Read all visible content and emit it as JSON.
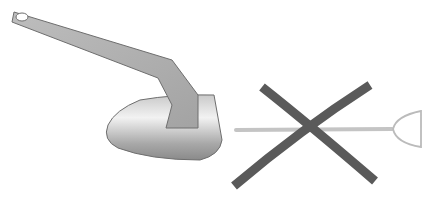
{
  "illustration": {
    "subject": "anchor-vs-crossed-out-shovel-style-anchor",
    "colors": {
      "background": "#ffffff",
      "anchor_fill_light": "#e2e2e2",
      "anchor_fill_dark": "#9a9a9a",
      "anchor_outline": "#6e6e6e",
      "cross_stroke": "#5a5a5a",
      "shovel_stroke": "#b8b8b8"
    },
    "items": [
      {
        "name": "plow-anchor",
        "label": ""
      },
      {
        "name": "shovel-anchor",
        "label": ""
      },
      {
        "name": "cross-mark",
        "label": ""
      }
    ]
  }
}
